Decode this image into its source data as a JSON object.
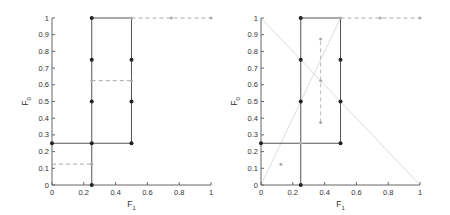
{
  "chart_data": [
    {
      "type": "line",
      "panel": "left",
      "title": "",
      "xlabel": "F1",
      "ylabel": "F0",
      "xlim": [
        0,
        1
      ],
      "ylim": [
        0,
        1
      ],
      "xticks": [
        "0",
        "0.2",
        "0.4",
        "0.6",
        "0.8",
        "1"
      ],
      "yticks": [
        "0",
        "0.1",
        "0.2",
        "0.3",
        "0.4",
        "0.5",
        "0.6",
        "0.7",
        "0.8",
        "0.9",
        "1"
      ],
      "grid": false,
      "legend": null,
      "series": [
        {
          "name": "solid-boundary",
          "style": "solid",
          "color": "#555555",
          "points": [
            [
              0,
              0.25
            ],
            [
              0.5,
              0.25
            ],
            [
              0.5,
              1
            ],
            [
              0.25,
              1
            ],
            [
              0.25,
              0
            ]
          ]
        },
        {
          "name": "solid-markers",
          "style": "markers",
          "color": "#222222",
          "points": [
            [
              0,
              0.25
            ],
            [
              0.25,
              0.25
            ],
            [
              0.5,
              0.25
            ],
            [
              0.25,
              0
            ],
            [
              0.25,
              0.5
            ],
            [
              0.25,
              0.75
            ],
            [
              0.25,
              1
            ],
            [
              0.5,
              0.5
            ],
            [
              0.5,
              0.75
            ]
          ]
        },
        {
          "name": "dashed-gray",
          "style": "dashed",
          "color": "#aaaaaa",
          "points": [
            [
              0,
              0.125
            ],
            [
              0.25,
              0.125
            ]
          ]
        },
        {
          "name": "dashed-gray-2",
          "style": "dashed",
          "color": "#aaaaaa",
          "points": [
            [
              0.25,
              0.625
            ],
            [
              0.5,
              0.625
            ]
          ]
        },
        {
          "name": "dashed-gray-top",
          "style": "dashed",
          "color": "#aaaaaa",
          "points": [
            [
              0.5,
              1
            ],
            [
              0.75,
              1
            ],
            [
              1,
              1
            ]
          ]
        },
        {
          "name": "gray-markers",
          "style": "markers",
          "color": "#aaaaaa",
          "points": [
            [
              0.25,
              0.125
            ],
            [
              0.25,
              0.625
            ],
            [
              0.5,
              0.625
            ],
            [
              0.5,
              1
            ],
            [
              0.75,
              1
            ],
            [
              1,
              1
            ]
          ]
        }
      ]
    },
    {
      "type": "line",
      "panel": "right",
      "title": "",
      "xlabel": "F1",
      "ylabel": "F0",
      "xlim": [
        0,
        1
      ],
      "ylim": [
        0,
        1
      ],
      "xticks": [
        "0",
        "0.2",
        "0.4",
        "0.6",
        "0.8",
        "1"
      ],
      "yticks": [
        "0",
        "0.1",
        "0.2",
        "0.3",
        "0.4",
        "0.5",
        "0.6",
        "0.7",
        "0.8",
        "0.9",
        "1"
      ],
      "grid": false,
      "legend": null,
      "series": [
        {
          "name": "solid-boundary",
          "style": "solid",
          "color": "#555555",
          "points": [
            [
              0,
              0.25
            ],
            [
              0.5,
              0.25
            ],
            [
              0.5,
              1
            ],
            [
              0.25,
              1
            ],
            [
              0.25,
              0
            ]
          ]
        },
        {
          "name": "solid-markers",
          "style": "markers",
          "color": "#222222",
          "points": [
            [
              0,
              0.25
            ],
            [
              0.5,
              0.25
            ],
            [
              0.25,
              0
            ],
            [
              0.25,
              0.5
            ],
            [
              0.25,
              0.75
            ],
            [
              0.25,
              1
            ],
            [
              0.5,
              0.5
            ],
            [
              0.5,
              0.75
            ]
          ]
        },
        {
          "name": "diagonal-faint-1",
          "style": "faint",
          "color": "#dddddd",
          "points": [
            [
              0,
              1
            ],
            [
              1,
              0
            ]
          ]
        },
        {
          "name": "diagonal-faint-2",
          "style": "faint",
          "color": "#dddddd",
          "points": [
            [
              0,
              0
            ],
            [
              0.5,
              1
            ]
          ]
        },
        {
          "name": "dashed-vertical",
          "style": "dashed",
          "color": "#bbbbbb",
          "points": [
            [
              0.375,
              0.375
            ],
            [
              0.375,
              0.875
            ]
          ]
        },
        {
          "name": "dashed-gray-top",
          "style": "dashed",
          "color": "#aaaaaa",
          "points": [
            [
              0.5,
              1
            ],
            [
              0.75,
              1
            ],
            [
              1,
              1
            ]
          ]
        },
        {
          "name": "gray-markers",
          "style": "markers",
          "color": "#aaaaaa",
          "points": [
            [
              0.125,
              0.125
            ],
            [
              0.25,
              0.25
            ],
            [
              0.375,
              0.375
            ],
            [
              0.375,
              0.625
            ],
            [
              0.375,
              0.875
            ],
            [
              0.5,
              1
            ],
            [
              0.75,
              1
            ],
            [
              1,
              1
            ]
          ]
        }
      ]
    }
  ],
  "panels": {
    "left": {
      "x0": 52,
      "x1": 211,
      "y0": 185,
      "y1": 18
    },
    "right": {
      "x0": 261,
      "x1": 420,
      "y0": 185,
      "y1": 18
    }
  }
}
